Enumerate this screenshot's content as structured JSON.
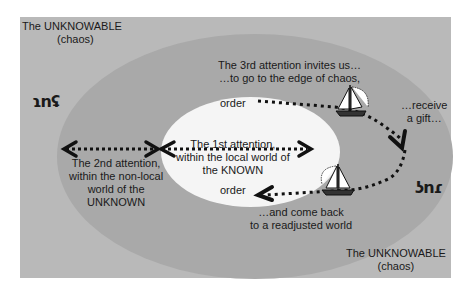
{
  "diagram": {
    "regions": {
      "outer": {
        "label": "The UNKNOWABLE",
        "sub": "(chaos)",
        "color": "#b9b9b9"
      },
      "middle": {
        "label": "The UNKNOWN",
        "color": "#a9a9a9"
      },
      "inner": {
        "label": "The KNOWN",
        "color": "#f5f5f5"
      }
    },
    "labels": {
      "unknowable_top_1": "The UNKNOWABLE",
      "unknowable_top_2": "(chaos)",
      "unknowable_bottom_1": "The UNKNOWABLE",
      "unknowable_bottom_2": "(chaos)",
      "third_attention_1": "The 3rd attention invites us…",
      "third_attention_2": "…to go to the edge of chaos,",
      "order_top": "order",
      "order_bottom": "order",
      "receive_1": "…receive",
      "receive_2": "a gift…",
      "first_attention_1": "The 1st attention,",
      "first_attention_2": "within the local world of",
      "first_attention_3": "the KNOWN",
      "second_attention_1": "The 2nd attention,",
      "second_attention_2": "within the non-local",
      "second_attention_3": "world of the",
      "second_attention_4": "UNKNOWN",
      "come_back_1": "…and come back",
      "come_back_2": "to a readjusted world",
      "glyph_left": "ɿnʢ",
      "glyph_right": "ʖnɾ"
    },
    "icons": [
      "sailboat-icon-outbound",
      "sailboat-icon-return",
      "arrowhead-icon"
    ]
  }
}
